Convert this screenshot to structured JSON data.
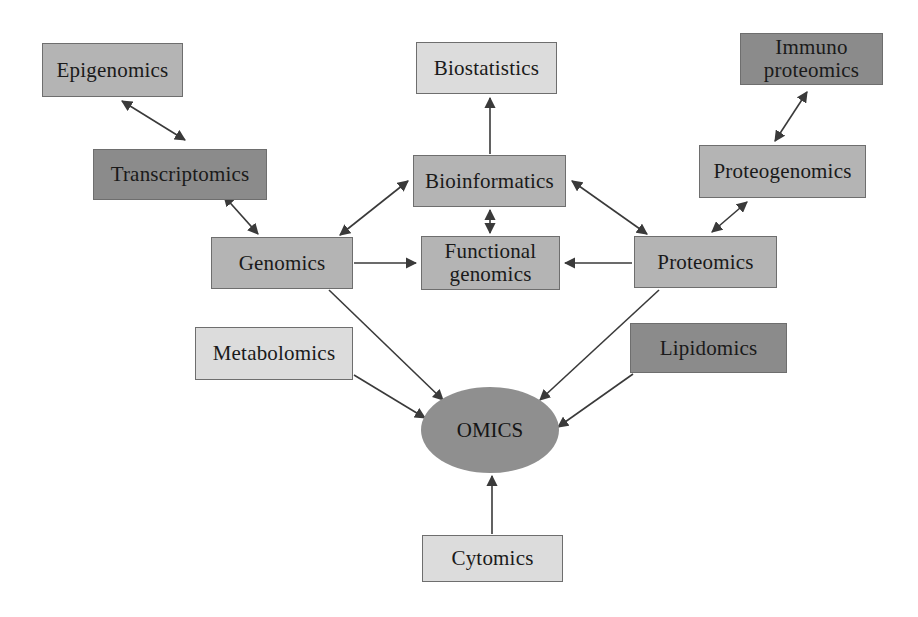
{
  "diagram": {
    "background_color": "#ffffff",
    "edge_color": "#3a3a3a",
    "palette": {
      "light": "#dcdcdc",
      "mid": "#b4b4b4",
      "dark": "#8b8b8b",
      "hub": "#8f8f8f",
      "border": "#6e6e6e",
      "text": "#1a1a1a"
    },
    "hub": {
      "label": "OMICS",
      "tone": "hub",
      "shape": "ellipse",
      "cx": 490,
      "cy": 430,
      "rx": 69,
      "ry": 43
    },
    "nodes": [
      {
        "id": "epigenomics",
        "label": "Epigenomics",
        "tone": "mid",
        "x": 42,
        "y": 43,
        "w": 141,
        "h": 54
      },
      {
        "id": "transcriptomics",
        "label": "Transcriptomics",
        "tone": "dark",
        "x": 93,
        "y": 149,
        "w": 174,
        "h": 51
      },
      {
        "id": "genomics",
        "label": "Genomics",
        "tone": "mid",
        "x": 211,
        "y": 237,
        "w": 142,
        "h": 52
      },
      {
        "id": "metabolomics",
        "label": "Metabolomics",
        "tone": "light",
        "x": 195,
        "y": 327,
        "w": 158,
        "h": 53
      },
      {
        "id": "biostatistics",
        "label": "Biostatistics",
        "tone": "light",
        "x": 416,
        "y": 42,
        "w": 141,
        "h": 52
      },
      {
        "id": "bioinformatics",
        "label": "Bioinformatics",
        "tone": "mid",
        "x": 413,
        "y": 155,
        "w": 153,
        "h": 52
      },
      {
        "id": "functional-genomics",
        "label": "Functional\ngenomics",
        "tone": "mid",
        "x": 421,
        "y": 236,
        "w": 139,
        "h": 54
      },
      {
        "id": "cytomics",
        "label": "Cytomics",
        "tone": "light",
        "x": 422,
        "y": 535,
        "w": 141,
        "h": 47
      },
      {
        "id": "immuno-proteomics",
        "label": "Immuno\nproteomics",
        "tone": "dark",
        "x": 740,
        "y": 33,
        "w": 143,
        "h": 52
      },
      {
        "id": "proteogenomics",
        "label": "Proteogenomics",
        "tone": "mid",
        "x": 699,
        "y": 145,
        "w": 167,
        "h": 53
      },
      {
        "id": "proteomics",
        "label": "Proteomics",
        "tone": "mid",
        "x": 634,
        "y": 236,
        "w": 143,
        "h": 52
      },
      {
        "id": "lipidomics",
        "label": "Lipidomics",
        "tone": "dark",
        "x": 630,
        "y": 323,
        "w": 157,
        "h": 50
      }
    ],
    "edges": [
      {
        "id": "epigenomics-transcriptomics",
        "from": "epigenomics",
        "to": "transcriptomics",
        "arrows": "both",
        "x1": 185,
        "y1": 140,
        "x2": 122,
        "y2": 101
      },
      {
        "id": "transcriptomics-genomics",
        "from": "transcriptomics",
        "to": "genomics",
        "arrows": "both",
        "x1": 224,
        "y1": 196,
        "x2": 258,
        "y2": 234
      },
      {
        "id": "genomics-bioinformatics",
        "from": "genomics",
        "to": "bioinformatics",
        "arrows": "both",
        "x1": 340,
        "y1": 235,
        "x2": 408,
        "y2": 181
      },
      {
        "id": "genomics-functional",
        "from": "genomics",
        "to": "functional-genomics",
        "arrows": "to",
        "x1": 354,
        "y1": 263,
        "x2": 416,
        "y2": 263
      },
      {
        "id": "bioinformatics-biostatistics",
        "from": "bioinformatics",
        "to": "biostatistics",
        "arrows": "to",
        "x1": 490,
        "y1": 154,
        "x2": 490,
        "y2": 98
      },
      {
        "id": "bioinformatics-functional",
        "from": "bioinformatics",
        "to": "functional-genomics",
        "arrows": "both",
        "x1": 490,
        "y1": 210,
        "x2": 490,
        "y2": 233
      },
      {
        "id": "proteomics-bioinformatics",
        "from": "proteomics",
        "to": "bioinformatics",
        "arrows": "both",
        "x1": 647,
        "y1": 234,
        "x2": 572,
        "y2": 181
      },
      {
        "id": "proteomics-functional",
        "from": "proteomics",
        "to": "functional-genomics",
        "arrows": "to",
        "x1": 632,
        "y1": 263,
        "x2": 565,
        "y2": 263
      },
      {
        "id": "proteomics-proteogenomics",
        "from": "proteomics",
        "to": "proteogenomics",
        "arrows": "both",
        "x1": 712,
        "y1": 232,
        "x2": 747,
        "y2": 202
      },
      {
        "id": "proteogenomics-immuno",
        "from": "proteogenomics",
        "to": "immuno-proteomics",
        "arrows": "both",
        "x1": 775,
        "y1": 141,
        "x2": 807,
        "y2": 92
      },
      {
        "id": "genomics-omics",
        "from": "genomics",
        "to": "hub",
        "arrows": "to",
        "x1": 329,
        "y1": 290,
        "x2": 443,
        "y2": 400
      },
      {
        "id": "metabolomics-omics",
        "from": "metabolomics",
        "to": "hub",
        "arrows": "to",
        "x1": 354,
        "y1": 375,
        "x2": 425,
        "y2": 418
      },
      {
        "id": "proteomics-omics",
        "from": "proteomics",
        "to": "hub",
        "arrows": "to",
        "x1": 659,
        "y1": 290,
        "x2": 540,
        "y2": 400
      },
      {
        "id": "lipidomics-omics",
        "from": "lipidomics",
        "to": "hub",
        "arrows": "to",
        "x1": 633,
        "y1": 374,
        "x2": 558,
        "y2": 427
      },
      {
        "id": "cytomics-omics",
        "from": "cytomics",
        "to": "hub",
        "arrows": "to",
        "x1": 492,
        "y1": 534,
        "x2": 492,
        "y2": 476
      }
    ]
  }
}
